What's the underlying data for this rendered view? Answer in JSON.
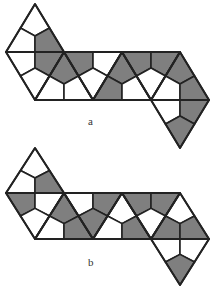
{
  "figure": {
    "colors": {
      "fill": "#7f7f7f",
      "empty": "#ffffff",
      "stroke": "#222222"
    },
    "half_width": 29,
    "nets": [
      {
        "label": "a",
        "label_pos": [
          88,
          115
        ],
        "rows_y": [
          4,
          52,
          100,
          148
        ],
        "triangles": [
          {
            "v": [
              [
                35,
                0
              ],
              [
                6,
                1
              ],
              [
                64,
                1
              ]
            ],
            "shade": [
              0,
              0,
              1
            ]
          },
          {
            "v": [
              [
                6,
                1
              ],
              [
                64,
                1
              ],
              [
                35,
                2
              ]
            ],
            "shade": [
              0,
              1,
              0
            ]
          },
          {
            "v": [
              [
                64,
                1
              ],
              [
                35,
                2
              ],
              [
                93,
                2
              ]
            ],
            "shade": [
              1,
              0,
              0
            ]
          },
          {
            "v": [
              [
                64,
                1
              ],
              [
                122,
                1
              ],
              [
                93,
                2
              ]
            ],
            "shade": [
              1,
              0,
              0
            ]
          },
          {
            "v": [
              [
                122,
                1
              ],
              [
                93,
                2
              ],
              [
                151,
                2
              ]
            ],
            "shade": [
              1,
              1,
              0
            ]
          },
          {
            "v": [
              [
                122,
                1
              ],
              [
                180,
                1
              ],
              [
                151,
                2
              ]
            ],
            "shade": [
              1,
              1,
              0
            ]
          },
          {
            "v": [
              [
                180,
                1
              ],
              [
                151,
                2
              ],
              [
                209,
                2
              ]
            ],
            "shade": [
              1,
              0,
              1
            ]
          },
          {
            "v": [
              [
                151,
                2
              ],
              [
                209,
                2
              ],
              [
                180,
                3
              ]
            ],
            "shade": [
              0,
              1,
              1
            ]
          }
        ]
      },
      {
        "label": "b",
        "label_pos": [
          88,
          256
        ],
        "rows_y": [
          148,
          193,
          239,
          285
        ],
        "triangles": [
          {
            "v": [
              [
                35,
                0
              ],
              [
                6,
                1
              ],
              [
                64,
                1
              ]
            ],
            "shade": [
              0,
              0,
              1
            ]
          },
          {
            "v": [
              [
                6,
                1
              ],
              [
                64,
                1
              ],
              [
                35,
                2
              ]
            ],
            "shade": [
              1,
              0,
              0
            ]
          },
          {
            "v": [
              [
                64,
                1
              ],
              [
                35,
                2
              ],
              [
                93,
                2
              ]
            ],
            "shade": [
              1,
              0,
              1
            ]
          },
          {
            "v": [
              [
                64,
                1
              ],
              [
                122,
                1
              ],
              [
                93,
                2
              ]
            ],
            "shade": [
              0,
              1,
              1
            ]
          },
          {
            "v": [
              [
                122,
                1
              ],
              [
                93,
                2
              ],
              [
                151,
                2
              ]
            ],
            "shade": [
              0,
              0,
              1
            ]
          },
          {
            "v": [
              [
                122,
                1
              ],
              [
                180,
                1
              ],
              [
                151,
                2
              ]
            ],
            "shade": [
              1,
              1,
              0
            ]
          },
          {
            "v": [
              [
                180,
                1
              ],
              [
                151,
                2
              ],
              [
                209,
                2
              ]
            ],
            "shade": [
              0,
              1,
              1
            ]
          },
          {
            "v": [
              [
                151,
                2
              ],
              [
                209,
                2
              ],
              [
                180,
                3
              ]
            ],
            "shade": [
              0,
              0,
              1
            ]
          }
        ]
      }
    ]
  }
}
